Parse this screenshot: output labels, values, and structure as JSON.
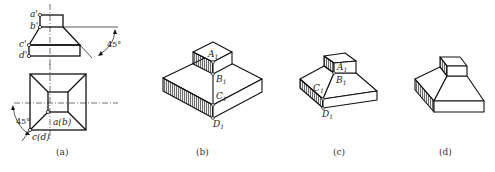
{
  "figure": {
    "panels": [
      {
        "id": "a",
        "caption": "(a)",
        "description": "Orthographic views (front and top) of a frustum-topped block",
        "front_view_labels": [
          "a'",
          "b'",
          "c'",
          "d'"
        ],
        "top_view_labels": [
          "a(b)",
          "c(d)"
        ],
        "angle_annotations": [
          "45°",
          "45°"
        ]
      },
      {
        "id": "b",
        "caption": "(b)",
        "description": "Isometric sketch: step 1 — block and top prism",
        "point_labels": [
          "A",
          "B",
          "C",
          "D"
        ],
        "subscript": "1"
      },
      {
        "id": "c",
        "caption": "(c)",
        "description": "Isometric sketch: step 2 — connecting sloped faces",
        "point_labels": [
          "A",
          "B",
          "C",
          "D"
        ],
        "subscript": "1"
      },
      {
        "id": "d",
        "caption": "(d)",
        "description": "Final isometric drawing"
      }
    ]
  },
  "colors": {
    "line": "#111111",
    "hatch": "#333333",
    "centerline": "#333333",
    "background": "#ffffff"
  }
}
